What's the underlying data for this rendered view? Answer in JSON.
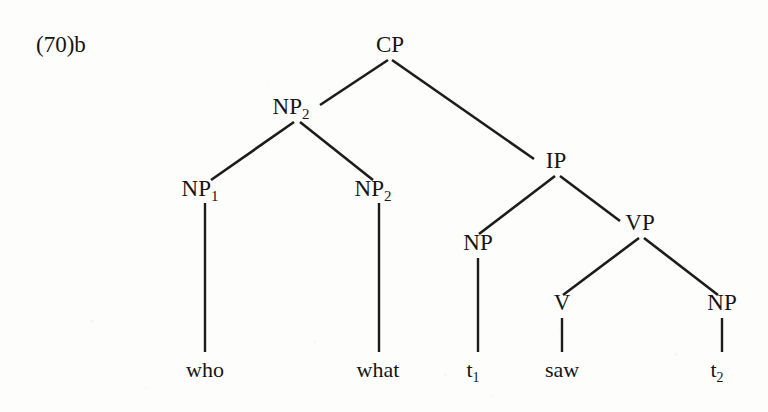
{
  "figure": {
    "example_number": "(70)b",
    "kind": "syntax-tree",
    "background_color": "#fdfdfc",
    "ink_color": "#151515"
  },
  "tree": {
    "nodes": [
      {
        "id": "cp",
        "label": "CP",
        "sub": "",
        "x": 390,
        "y": 52
      },
      {
        "id": "np2a",
        "label": "NP",
        "sub": "2",
        "x": 296,
        "y": 114
      },
      {
        "id": "np1",
        "label": "NP",
        "sub": "1",
        "x": 205,
        "y": 196
      },
      {
        "id": "np2b",
        "label": "NP",
        "sub": "2",
        "x": 378,
        "y": 196
      },
      {
        "id": "ip",
        "label": "IP",
        "sub": "",
        "x": 556,
        "y": 168
      },
      {
        "id": "npsub",
        "label": "NP",
        "sub": "",
        "x": 478,
        "y": 250
      },
      {
        "id": "vp",
        "label": "VP",
        "sub": "",
        "x": 640,
        "y": 230
      },
      {
        "id": "v",
        "label": "V",
        "sub": "",
        "x": 562,
        "y": 310
      },
      {
        "id": "npobj",
        "label": "NP",
        "sub": "",
        "x": 722,
        "y": 310
      }
    ],
    "terminals": [
      {
        "id": "who",
        "label": "who",
        "sub": "",
        "x": 205,
        "y": 377
      },
      {
        "id": "what",
        "label": "what",
        "sub": "",
        "x": 378,
        "y": 377
      },
      {
        "id": "t1",
        "label": "t",
        "sub": "1",
        "x": 478,
        "y": 377
      },
      {
        "id": "saw",
        "label": "saw",
        "sub": "",
        "x": 562,
        "y": 377
      },
      {
        "id": "t2",
        "label": "t",
        "sub": "2",
        "x": 722,
        "y": 377
      }
    ],
    "branches": [
      {
        "id": "cp-np2a",
        "from": "cp",
        "to": "np2a",
        "x1": 388,
        "y1": 60,
        "x2": 320,
        "y2": 105
      },
      {
        "id": "cp-ip",
        "from": "cp",
        "to": "ip",
        "x1": 392,
        "y1": 60,
        "x2": 534,
        "y2": 159
      },
      {
        "id": "np2a-np1",
        "from": "np2a",
        "to": "np1",
        "x1": 294,
        "y1": 122,
        "x2": 211,
        "y2": 180
      },
      {
        "id": "np2a-np2b",
        "from": "np2a",
        "to": "np2b",
        "x1": 300,
        "y1": 122,
        "x2": 373,
        "y2": 180
      },
      {
        "id": "ip-np",
        "from": "ip",
        "to": "npsub",
        "x1": 555,
        "y1": 176,
        "x2": 479,
        "y2": 234
      },
      {
        "id": "ip-vp",
        "from": "ip",
        "to": "vp",
        "x1": 560,
        "y1": 176,
        "x2": 620,
        "y2": 221
      },
      {
        "id": "vp-v",
        "from": "vp",
        "to": "v",
        "x1": 639,
        "y1": 238,
        "x2": 563,
        "y2": 295
      },
      {
        "id": "vp-npobj",
        "from": "vp",
        "to": "npobj",
        "x1": 644,
        "y1": 238,
        "x2": 718,
        "y2": 295
      }
    ],
    "stems": [
      {
        "id": "np1-who",
        "from": "np1",
        "to": "who",
        "x": 205,
        "y1": 203,
        "y2": 352
      },
      {
        "id": "np2b-what",
        "from": "np2b",
        "to": "what",
        "x": 379,
        "y1": 203,
        "y2": 352
      },
      {
        "id": "np-t1",
        "from": "npsub",
        "to": "t1",
        "x": 478,
        "y1": 258,
        "y2": 352
      },
      {
        "id": "v-saw",
        "from": "v",
        "to": "saw",
        "x": 562,
        "y1": 318,
        "y2": 352
      },
      {
        "id": "npobj-t2",
        "from": "npobj",
        "to": "t2",
        "x": 722,
        "y1": 318,
        "y2": 352
      }
    ],
    "sentence": "who what t1 saw t2",
    "root": "CP"
  }
}
